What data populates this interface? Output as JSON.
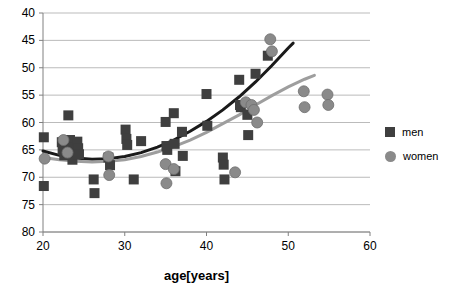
{
  "chart_data": {
    "type": "scatter",
    "title": "",
    "xlabel": "age[years]",
    "ylabel": "",
    "xlim": [
      20,
      60
    ],
    "ylim": [
      40,
      80
    ],
    "xticks": [
      20,
      30,
      40,
      50,
      60
    ],
    "yticks": [
      40,
      45,
      50,
      55,
      60,
      65,
      70,
      75,
      80
    ],
    "grid": "horizontal",
    "legend_position": "right",
    "series": [
      {
        "name": "men",
        "marker": "square",
        "color": "#3f3f3f",
        "points": [
          [
            20.1,
            57.3
          ],
          [
            20.1,
            48.4
          ],
          [
            22.3,
            56.4
          ],
          [
            22.4,
            55.0
          ],
          [
            22.6,
            54.0
          ],
          [
            23.1,
            61.3
          ],
          [
            23.3,
            56.8
          ],
          [
            23.4,
            55.5
          ],
          [
            23.5,
            54.2
          ],
          [
            23.6,
            53.2
          ],
          [
            24.2,
            56.5
          ],
          [
            24.3,
            55.3
          ],
          [
            24.4,
            54.2
          ],
          [
            26.2,
            49.6
          ],
          [
            26.3,
            47.1
          ],
          [
            28.0,
            53.6
          ],
          [
            28.2,
            52.2
          ],
          [
            30.1,
            58.7
          ],
          [
            30.2,
            57.0
          ],
          [
            30.3,
            55.9
          ],
          [
            31.1,
            49.6
          ],
          [
            32.0,
            56.6
          ],
          [
            35.0,
            60.1
          ],
          [
            35.1,
            55.7
          ],
          [
            35.2,
            55.0
          ],
          [
            36.0,
            61.7
          ],
          [
            36.1,
            56.1
          ],
          [
            36.2,
            51.1
          ],
          [
            37.0,
            58.3
          ],
          [
            37.1,
            53.9
          ],
          [
            40.0,
            65.2
          ],
          [
            40.1,
            59.4
          ],
          [
            42.0,
            53.6
          ],
          [
            42.1,
            52.3
          ],
          [
            42.2,
            49.6
          ],
          [
            44.0,
            67.8
          ],
          [
            44.1,
            63.2
          ],
          [
            44.2,
            62.8
          ],
          [
            45.0,
            61.4
          ],
          [
            45.1,
            57.7
          ],
          [
            46.0,
            68.9
          ],
          [
            47.5,
            72.2
          ]
        ]
      },
      {
        "name": "women",
        "marker": "circle",
        "color": "#8a8a8a",
        "points": [
          [
            20.2,
            53.4
          ],
          [
            22.5,
            56.8
          ],
          [
            23.0,
            54.5
          ],
          [
            28.0,
            53.8
          ],
          [
            28.1,
            50.4
          ],
          [
            35.0,
            52.4
          ],
          [
            35.1,
            48.9
          ],
          [
            36.0,
            51.5
          ],
          [
            43.5,
            50.9
          ],
          [
            44.8,
            63.7
          ],
          [
            45.5,
            63.2
          ],
          [
            45.8,
            62.3
          ],
          [
            46.2,
            60.0
          ],
          [
            47.8,
            75.2
          ],
          [
            48.0,
            73.0
          ],
          [
            51.9,
            65.7
          ],
          [
            52.0,
            62.8
          ],
          [
            54.8,
            65.1
          ],
          [
            54.9,
            63.2
          ]
        ]
      }
    ],
    "trendlines": [
      {
        "name": "men-trend",
        "color": "#1a1a1a",
        "width": 3,
        "path_points": [
          [
            20.0,
            54.8
          ],
          [
            22.0,
            54.0
          ],
          [
            24.0,
            53.5
          ],
          [
            26.0,
            53.3
          ],
          [
            28.0,
            53.4
          ],
          [
            30.0,
            53.8
          ],
          [
            32.0,
            54.5
          ],
          [
            34.0,
            55.5
          ],
          [
            36.0,
            56.8
          ],
          [
            38.0,
            58.4
          ],
          [
            40.0,
            60.2
          ],
          [
            42.0,
            62.3
          ],
          [
            44.0,
            64.7
          ],
          [
            46.0,
            67.4
          ],
          [
            48.0,
            70.4
          ],
          [
            50.0,
            73.6
          ],
          [
            50.6,
            74.5
          ]
        ]
      },
      {
        "name": "women-trend",
        "color": "#9e9e9e",
        "width": 3,
        "path_points": [
          [
            20.0,
            53.6
          ],
          [
            22.0,
            53.2
          ],
          [
            24.0,
            52.9
          ],
          [
            26.0,
            52.8
          ],
          [
            28.0,
            52.9
          ],
          [
            30.0,
            53.2
          ],
          [
            32.0,
            53.8
          ],
          [
            34.0,
            54.6
          ],
          [
            36.0,
            55.6
          ],
          [
            38.0,
            56.8
          ],
          [
            40.0,
            58.2
          ],
          [
            42.0,
            59.8
          ],
          [
            44.0,
            61.4
          ],
          [
            46.0,
            63.2
          ],
          [
            48.0,
            64.9
          ],
          [
            50.0,
            66.5
          ],
          [
            52.0,
            67.9
          ],
          [
            53.2,
            68.6
          ]
        ]
      }
    ]
  },
  "axes": {
    "y_tick_labels": [
      "80",
      "75",
      "70",
      "65",
      "60",
      "55",
      "50",
      "45",
      "40"
    ],
    "x_tick_labels": [
      "20",
      "30",
      "40",
      "50",
      "60"
    ],
    "x_title": "age[years]"
  },
  "legend": {
    "items": [
      {
        "label": "men",
        "marker": "square",
        "color": "#3f3f3f"
      },
      {
        "label": "women",
        "marker": "circle",
        "color": "#8a8a8a"
      }
    ]
  },
  "colors": {
    "men": "#3f3f3f",
    "women": "#8a8a8a",
    "men_trend": "#1a1a1a",
    "women_trend": "#9e9e9e",
    "grid": "#a9a9a9",
    "axis": "#808080",
    "background": "#ffffff"
  }
}
